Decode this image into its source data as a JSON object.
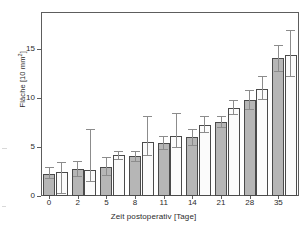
{
  "chart_data": {
    "type": "bar",
    "title": "",
    "subtitle": "",
    "xlabel": "Zeit postoperativ [Tage]",
    "ylabel": "Fläche [10 mm²]",
    "ylabel_prefix": "Fläche [10 mm",
    "ylabel_exponent": "2",
    "ylabel_suffix": "]",
    "categories": [
      "0",
      "2",
      "5",
      "8",
      "11",
      "14",
      "21",
      "28",
      "35"
    ],
    "ytick_labels": [
      "0",
      "5",
      "10",
      "15"
    ],
    "ytick_values": [
      0,
      5,
      10,
      15
    ],
    "ylim": [
      0,
      18.8
    ],
    "xlim_note": "9 category pairs, 18 bars total",
    "grid": false,
    "legend": "none",
    "series": [
      {
        "name": "Gruppe A",
        "color": "#b6b6b6",
        "fill": "gray",
        "values": [
          2.25,
          2.75,
          2.95,
          4.1,
          5.4,
          6.0,
          7.55,
          9.8,
          14.05
        ],
        "err_low": [
          0.55,
          0.85,
          0.95,
          0.6,
          0.75,
          0.85,
          0.6,
          1.0,
          1.35
        ],
        "err_high": [
          0.7,
          0.85,
          1.05,
          0.5,
          0.75,
          0.85,
          0.65,
          1.0,
          1.35
        ]
      },
      {
        "name": "Gruppe B",
        "color": "#fbfbfb",
        "fill": "white",
        "values": [
          2.45,
          2.7,
          4.2,
          5.55,
          6.1,
          7.25,
          9.0,
          10.9,
          14.4
        ],
        "err_low": [
          2.25,
          1.25,
          0.5,
          1.45,
          1.2,
          0.8,
          0.75,
          1.1,
          2.2
        ],
        "err_high": [
          1.0,
          4.15,
          0.4,
          2.6,
          2.4,
          0.95,
          0.8,
          1.4,
          2.6
        ]
      }
    ],
    "bar_edge_color": "#4a4a4a",
    "errorbar_color": "#8c8c8c",
    "axis_color": "#5d5d5d",
    "background_color": "#ffffff"
  }
}
